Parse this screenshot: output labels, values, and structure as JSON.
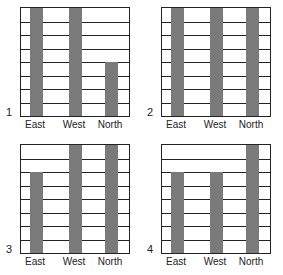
{
  "chart_data": [
    {
      "type": "bar",
      "panel_label": "1",
      "categories": [
        "East",
        "West",
        "North"
      ],
      "values": [
        8,
        8,
        4
      ],
      "ylim": [
        0,
        8
      ],
      "grid": true
    },
    {
      "type": "bar",
      "panel_label": "2",
      "categories": [
        "East",
        "West",
        "North"
      ],
      "values": [
        8,
        8,
        8
      ],
      "ylim": [
        0,
        8
      ],
      "grid": true
    },
    {
      "type": "bar",
      "panel_label": "3",
      "categories": [
        "East",
        "West",
        "North"
      ],
      "values": [
        6,
        8,
        8
      ],
      "ylim": [
        0,
        8
      ],
      "grid": true
    },
    {
      "type": "bar",
      "panel_label": "4",
      "categories": [
        "East",
        "West",
        "North"
      ],
      "values": [
        6,
        6,
        8
      ],
      "ylim": [
        0,
        8
      ],
      "grid": true
    }
  ],
  "style": {
    "bar_color": "#7a7a7a",
    "grid_color": "#222222"
  }
}
